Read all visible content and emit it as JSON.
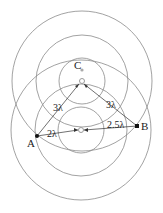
{
  "diagram": {
    "type": "two-source wave interference",
    "sources": [
      {
        "id": "S1",
        "cx": 82,
        "cy": 81,
        "radii": [
          23,
          46,
          70
        ]
      },
      {
        "id": "S2",
        "cx": 81,
        "cy": 130,
        "radii": [
          23,
          46,
          70
        ]
      }
    ],
    "points": {
      "A": {
        "label": "A",
        "x": 37,
        "y": 136
      },
      "B": {
        "label": "B",
        "x": 137,
        "y": 126
      },
      "C": {
        "label": "C",
        "x": 82,
        "y": 70
      }
    },
    "distances": {
      "A_to_S2": "2λ",
      "A_to_S1": "3λ",
      "B_to_S1": "3λ",
      "B_to_S2": "2.5λ"
    },
    "colors": {
      "lines": "#777777",
      "points": "#111111",
      "source": "#999999"
    }
  }
}
